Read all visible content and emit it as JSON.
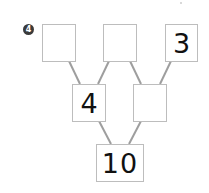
{
  "problem": {
    "number": "4",
    "top_row": [
      "",
      "",
      "3"
    ],
    "middle_row": [
      "4",
      ""
    ],
    "bottom": "10"
  },
  "colors": {
    "box_border": "#bdbdbd",
    "line": "#9e9e9e",
    "badge": "#3a3a3a",
    "text": "#111111"
  }
}
